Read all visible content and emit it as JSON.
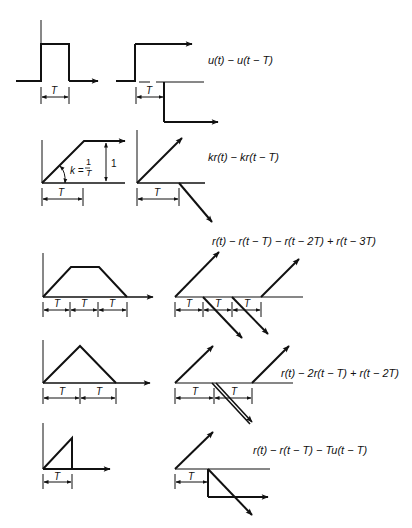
{
  "figure": {
    "rows": [
      {
        "name": "rectangular-pulse",
        "left_label_T": "T",
        "right_label_T": "T",
        "equation": "u(t) − u(t − T)"
      },
      {
        "name": "ramp-limited",
        "left_label_T": "T",
        "slope_label": "k = 1/T",
        "slope_k": "k =",
        "slope_num": "1",
        "slope_den": "T",
        "height_label": "1",
        "right_label_T": "T",
        "equation": "kr(t) − kr(t − T)"
      },
      {
        "name": "trapezoid",
        "left_labels_T": [
          "T",
          "T",
          "T"
        ],
        "right_labels_T": [
          "T",
          "T",
          "T"
        ],
        "equation": "r(t) − r(t − T) − r(t − 2T) + r(t − 3T)"
      },
      {
        "name": "triangle",
        "left_labels_T": [
          "T",
          "T"
        ],
        "right_labels_T": [
          "T",
          "T"
        ],
        "equation": "r(t) − 2r(t − T) + r(t − 2T)"
      },
      {
        "name": "sawtooth",
        "left_label_T": "T",
        "right_label_T": "T",
        "equation": "r(t) − r(t − T) − Tu(t − T)"
      }
    ]
  },
  "colors": {
    "ink": "#111111",
    "background": "#ffffff"
  }
}
